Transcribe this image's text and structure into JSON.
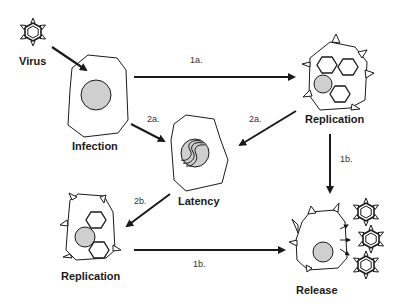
{
  "diagram": {
    "type": "viral life cycle",
    "nodes": {
      "virus": {
        "label": "Virus"
      },
      "infection": {
        "label": "Infection"
      },
      "replication_top": {
        "label": "Replication"
      },
      "latency": {
        "label": "Latency"
      },
      "replication_bottom": {
        "label": "Replication"
      },
      "release": {
        "label": "Release"
      }
    },
    "edges": [
      {
        "from": "virus",
        "to": "infection",
        "label": ""
      },
      {
        "from": "infection",
        "to": "replication_top",
        "label": "1a."
      },
      {
        "from": "infection",
        "to": "latency",
        "label": "2a."
      },
      {
        "from": "replication_top",
        "to": "latency",
        "label": "2a."
      },
      {
        "from": "replication_top",
        "to": "release",
        "label": "1b."
      },
      {
        "from": "latency",
        "to": "replication_bottom",
        "label": "2b."
      },
      {
        "from": "replication_bottom",
        "to": "release",
        "label": "1b."
      }
    ],
    "colors": {
      "stroke": "#1a1a1a",
      "nucleus": "#cfcfcf",
      "background": "#ffffff"
    }
  }
}
